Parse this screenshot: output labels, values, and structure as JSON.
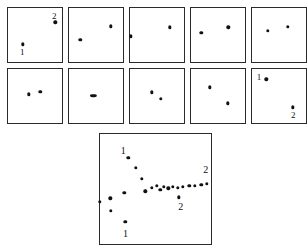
{
  "figure": {
    "title": "",
    "background_color": "#ffffff",
    "dot_color": "#111111",
    "border_color": "#2b2b2b",
    "panel_count": 11
  },
  "chart_data": {
    "type": "scatter",
    "title": "",
    "xlabel": "",
    "ylabel": "",
    "grid": false,
    "legend": "none",
    "xlim": [
      0,
      1
    ],
    "ylim": [
      0,
      1
    ],
    "panels": [
      {
        "name": "panel-1",
        "row": 1,
        "index": 1,
        "x": 7,
        "y": 7,
        "width": 56,
        "height": 56,
        "points": [
          {
            "id": "2",
            "x": 0.845,
            "y": 0.745,
            "label": "2",
            "label_x": 0.825,
            "label_y": 0.855
          },
          {
            "id": "1",
            "x": 0.265,
            "y": 0.355,
            "label": "1",
            "label_x": 0.255,
            "label_y": 0.215
          }
        ]
      },
      {
        "name": "panel-2",
        "row": 1,
        "index": 2,
        "x": 68,
        "y": 7,
        "width": 56,
        "height": 56,
        "points": [
          {
            "id": "2",
            "x": 0.745,
            "y": 0.675,
            "label": "",
            "label_x": 0,
            "label_y": 0
          },
          {
            "id": "1",
            "x": 0.205,
            "y": 0.435,
            "label": "",
            "label_x": 0,
            "label_y": 0
          }
        ]
      },
      {
        "name": "panel-3",
        "row": 1,
        "index": 3,
        "x": 129,
        "y": 7,
        "width": 56,
        "height": 56,
        "points": [
          {
            "id": "2",
            "x": 0.715,
            "y": 0.655,
            "label": "",
            "label_x": 0,
            "label_y": 0
          },
          {
            "id": "1",
            "x": 0.015,
            "y": 0.495,
            "label": "",
            "label_x": 0,
            "label_y": 0
          }
        ]
      },
      {
        "name": "panel-4",
        "row": 1,
        "index": 4,
        "x": 190,
        "y": 7,
        "width": 56,
        "height": 56,
        "points": [
          {
            "id": "2",
            "x": 0.665,
            "y": 0.655,
            "label": "",
            "label_x": 0,
            "label_y": 0
          },
          {
            "id": "1",
            "x": 0.185,
            "y": 0.555,
            "label": "",
            "label_x": 0,
            "label_y": 0
          }
        ]
      },
      {
        "name": "panel-5",
        "row": 1,
        "index": 5,
        "x": 251,
        "y": 7,
        "width": 56,
        "height": 56,
        "points": [
          {
            "id": "2",
            "x": 0.635,
            "y": 0.665,
            "label": "",
            "label_x": 0,
            "label_y": 0
          },
          {
            "id": "1",
            "x": 0.285,
            "y": 0.595,
            "label": "",
            "label_x": 0,
            "label_y": 0
          }
        ]
      },
      {
        "name": "panel-6",
        "row": 2,
        "index": 6,
        "x": 7,
        "y": 68,
        "width": 56,
        "height": 56,
        "points": [
          {
            "id": "2",
            "x": 0.575,
            "y": 0.595,
            "label": "",
            "label_x": 0,
            "label_y": 0
          },
          {
            "id": "1",
            "x": 0.375,
            "y": 0.545,
            "label": "",
            "label_x": 0,
            "label_y": 0
          }
        ]
      },
      {
        "name": "panel-7",
        "row": 2,
        "index": 7,
        "x": 68,
        "y": 68,
        "width": 56,
        "height": 56,
        "points": [
          {
            "id": "merged",
            "x": 0.435,
            "y": 0.525,
            "label": "",
            "label_x": 0,
            "label_y": 0
          }
        ]
      },
      {
        "name": "panel-8",
        "row": 2,
        "index": 8,
        "x": 129,
        "y": 68,
        "width": 56,
        "height": 56,
        "points": [
          {
            "id": "1",
            "x": 0.385,
            "y": 0.585,
            "label": "",
            "label_x": 0,
            "label_y": 0
          },
          {
            "id": "2",
            "x": 0.545,
            "y": 0.465,
            "label": "",
            "label_x": 0,
            "label_y": 0
          }
        ]
      },
      {
        "name": "panel-9",
        "row": 2,
        "index": 9,
        "x": 190,
        "y": 68,
        "width": 56,
        "height": 56,
        "points": [
          {
            "id": "1",
            "x": 0.335,
            "y": 0.675,
            "label": "",
            "label_x": 0,
            "label_y": 0
          },
          {
            "id": "2",
            "x": 0.655,
            "y": 0.385,
            "label": "",
            "label_x": 0,
            "label_y": 0
          }
        ]
      },
      {
        "name": "panel-10",
        "row": 2,
        "index": 10,
        "x": 251,
        "y": 68,
        "width": 56,
        "height": 56,
        "points": [
          {
            "id": "1",
            "x": 0.255,
            "y": 0.815,
            "label": "1",
            "label_x": 0.125,
            "label_y": 0.855
          },
          {
            "id": "2",
            "x": 0.725,
            "y": 0.315,
            "label": "2",
            "label_x": 0.735,
            "label_y": 0.175
          }
        ]
      },
      {
        "name": "panel-large",
        "row": 3,
        "index": 11,
        "x": 99,
        "y": 133,
        "width": 113,
        "height": 112,
        "points": [
          {
            "id": "t1",
            "x": 0.0,
            "y": 0.395,
            "label": "",
            "label_x": 0,
            "label_y": 0
          },
          {
            "id": "t2",
            "x": 0.09,
            "y": 0.425,
            "label": "",
            "label_x": 0,
            "label_y": 0
          },
          {
            "id": "t3",
            "x": 0.095,
            "y": 0.315,
            "label": "",
            "label_x": 0,
            "label_y": 0
          },
          {
            "id": "t4",
            "x": 0.215,
            "y": 0.475,
            "label": "",
            "label_x": 0,
            "label_y": 0
          },
          {
            "id": "t5",
            "x": 0.225,
            "y": 0.215,
            "label": "1",
            "label_x": 0.225,
            "label_y": 0.105
          },
          {
            "id": "t6",
            "x": 0.25,
            "y": 0.79,
            "label": "1",
            "label_x": 0.205,
            "label_y": 0.845
          },
          {
            "id": "t7",
            "x": 0.315,
            "y": 0.7,
            "label": "",
            "label_x": 0,
            "label_y": 0
          },
          {
            "id": "t8",
            "x": 0.37,
            "y": 0.6,
            "label": "",
            "label_x": 0,
            "label_y": 0
          },
          {
            "id": "t9",
            "x": 0.4,
            "y": 0.49,
            "label": "",
            "label_x": 0,
            "label_y": 0
          },
          {
            "id": "t10",
            "x": 0.46,
            "y": 0.52,
            "label": "",
            "label_x": 0,
            "label_y": 0
          },
          {
            "id": "t11",
            "x": 0.5,
            "y": 0.535,
            "label": "",
            "label_x": 0,
            "label_y": 0
          },
          {
            "id": "t12",
            "x": 0.535,
            "y": 0.5,
            "label": "",
            "label_x": 0,
            "label_y": 0
          },
          {
            "id": "t13",
            "x": 0.565,
            "y": 0.53,
            "label": "",
            "label_x": 0,
            "label_y": 0
          },
          {
            "id": "t14",
            "x": 0.605,
            "y": 0.515,
            "label": "",
            "label_x": 0,
            "label_y": 0
          },
          {
            "id": "t15",
            "x": 0.645,
            "y": 0.53,
            "label": "",
            "label_x": 0,
            "label_y": 0
          },
          {
            "id": "t16",
            "x": 0.69,
            "y": 0.52,
            "label": "",
            "label_x": 0,
            "label_y": 0
          },
          {
            "id": "t17",
            "x": 0.735,
            "y": 0.53,
            "label": "",
            "label_x": 0,
            "label_y": 0
          },
          {
            "id": "t18",
            "x": 0.7,
            "y": 0.435,
            "label": "2",
            "label_x": 0.715,
            "label_y": 0.345
          },
          {
            "id": "t19",
            "x": 0.79,
            "y": 0.535,
            "label": "",
            "label_x": 0,
            "label_y": 0
          },
          {
            "id": "t20",
            "x": 0.84,
            "y": 0.54,
            "label": "",
            "label_x": 0,
            "label_y": 0
          },
          {
            "id": "t21",
            "x": 0.895,
            "y": 0.545,
            "label": "",
            "label_x": 0,
            "label_y": 0
          },
          {
            "id": "t22",
            "x": 0.945,
            "y": 0.555,
            "label": "2",
            "label_x": 0.935,
            "label_y": 0.675
          }
        ]
      }
    ]
  }
}
